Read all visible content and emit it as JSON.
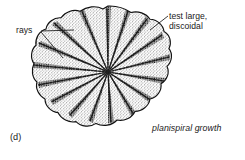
{
  "figure": {
    "letter": "(d)",
    "background_color": "#ffffff",
    "ink_color": "#1a1a1a"
  },
  "labels": {
    "rays": "rays",
    "test_large": "test large,\ndiscoidal",
    "test_large_line1": "test large,",
    "test_large_line2": "discoidal"
  },
  "caption": {
    "planispiral_growth": "planispiral growth"
  },
  "specimen": {
    "center_x": 108,
    "center_y": 72,
    "radius_x": 63,
    "radius_y": 66,
    "lobes": 17,
    "ray_count": 17,
    "outline_color": "#1a1a1a",
    "stipple_color": "#2a2a2a"
  },
  "leaders": {
    "rays_upper": "from (41,31) to (74,30)",
    "rays_lower": "from (41,33) to (63,58)",
    "test_large": "from (168,16) to (150,30)"
  }
}
